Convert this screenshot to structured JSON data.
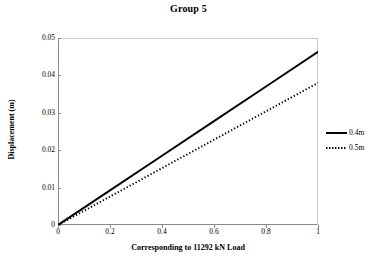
{
  "chart_data": {
    "type": "line",
    "title": "Group 5",
    "xlabel": "Corresponding to 11292 kN Load",
    "ylabel": "Displacement (m)",
    "xlim": [
      0,
      1
    ],
    "ylim": [
      0,
      0.05
    ],
    "xticks": [
      "0",
      "0.2",
      "0.4",
      "0.6",
      "0.8",
      "1"
    ],
    "xtick_values": [
      0,
      0.2,
      0.4,
      0.6,
      0.8,
      1
    ],
    "yticks": [
      "0",
      "0.01",
      "0.02",
      "0.03",
      "0.04",
      "0.05"
    ],
    "ytick_values": [
      0,
      0.01,
      0.02,
      0.03,
      0.04,
      0.05
    ],
    "grid": false,
    "legend_position": "right",
    "x": [
      0,
      0.2,
      0.4,
      0.6,
      0.8,
      1
    ],
    "series": [
      {
        "name": "0.4m",
        "style": "solid",
        "color": "#000000",
        "values": [
          0,
          0.00926,
          0.01852,
          0.02778,
          0.03704,
          0.0463
        ]
      },
      {
        "name": "0.5m",
        "style": "dotted",
        "color": "#000000",
        "values": [
          0,
          0.0076,
          0.0152,
          0.0228,
          0.0304,
          0.038
        ]
      }
    ]
  },
  "legend": {
    "items": [
      {
        "label": "0.4m"
      },
      {
        "label": "0.5m"
      }
    ]
  },
  "colors": {
    "axis": "#8a8a8a",
    "frame": "#c9c9c9",
    "series": "#000000",
    "background": "#ffffff"
  }
}
